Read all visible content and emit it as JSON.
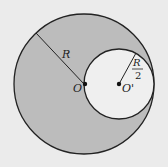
{
  "diagram": {
    "title": "",
    "colors": {
      "background": "#ebebeb",
      "shaded_region": "#bcbcbc",
      "inner_circle": "#efefef",
      "stroke": "#222222"
    },
    "big_circle": {
      "cx": 84,
      "cy": 84,
      "r": 70,
      "center_label": "O"
    },
    "small_circle": {
      "cx": 119,
      "cy": 84,
      "r": 35,
      "center_label": "O'"
    },
    "labels": {
      "big_radius": "R",
      "small_radius_num": "R",
      "small_radius_den": "2",
      "center_big": "O",
      "center_small": "O'"
    }
  }
}
